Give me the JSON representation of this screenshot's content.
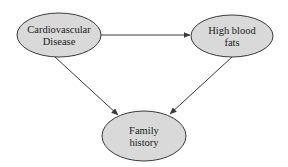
{
  "diagram": {
    "type": "directed-graph",
    "nodes": [
      {
        "id": "cardiovascular",
        "label_line1": "Cardiovascular",
        "label_line2": "Disease",
        "cx": 59,
        "cy": 35,
        "rx": 42,
        "ry": 22
      },
      {
        "id": "high-blood-fats",
        "label_line1": "High blood",
        "label_line2": "fats",
        "cx": 232,
        "cy": 36,
        "rx": 41,
        "ry": 21
      },
      {
        "id": "family-history",
        "label_line1": "Family",
        "label_line2": "history",
        "cx": 144,
        "cy": 136,
        "rx": 42,
        "ry": 25
      }
    ],
    "edges": [
      {
        "from": "cardiovascular",
        "to": "high-blood-fats",
        "x1": 101,
        "y1": 35,
        "x2": 190,
        "y2": 35
      },
      {
        "from": "cardiovascular",
        "to": "family-history",
        "x1": 55,
        "y1": 57,
        "x2": 118,
        "y2": 115
      },
      {
        "from": "high-blood-fats",
        "to": "family-history",
        "x1": 232,
        "y1": 57,
        "x2": 170,
        "y2": 114
      }
    ],
    "colors": {
      "node_fill": "#d9d9d9",
      "stroke": "#3a3a3a",
      "text": "#1a1a1a",
      "background": "#ffffff"
    }
  }
}
